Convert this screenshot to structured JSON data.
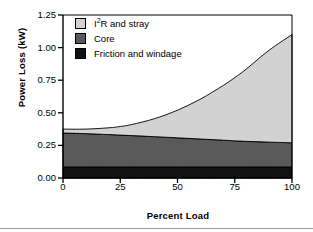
{
  "chart_data": {
    "type": "area",
    "title": "",
    "subtitle": "",
    "xlabel": "Percent Load",
    "ylabel": "Power Loss (kW)",
    "xlim": [
      0,
      100
    ],
    "ylim": [
      0.0,
      1.25
    ],
    "xticks": [
      "0",
      "25",
      "50",
      "75",
      "100"
    ],
    "xtick_values": [
      0,
      25,
      50,
      75,
      100
    ],
    "yticks": [
      "0.00",
      "0.25",
      "0.50",
      "0.75",
      "1.00",
      "1.25"
    ],
    "ytick_values": [
      0.0,
      0.25,
      0.5,
      0.75,
      1.0,
      1.25
    ],
    "grid": false,
    "stacked": true,
    "legend_position": "upper-left-inside",
    "x": [
      0,
      10,
      20,
      25,
      30,
      40,
      50,
      60,
      70,
      75,
      80,
      90,
      100
    ],
    "series": [
      {
        "name": "Friction and windage",
        "color": "#111111",
        "values": [
          0.085,
          0.085,
          0.085,
          0.085,
          0.085,
          0.085,
          0.085,
          0.085,
          0.085,
          0.085,
          0.085,
          0.085,
          0.085
        ]
      },
      {
        "name": "Core",
        "color": "#5a5a5a",
        "values": [
          0.26,
          0.255,
          0.248,
          0.244,
          0.24,
          0.232,
          0.223,
          0.214,
          0.205,
          0.2,
          0.196,
          0.19,
          0.185
        ]
      },
      {
        "name": "I2R and stray",
        "color": "#d2d2d2",
        "values": [
          0.03,
          0.035,
          0.052,
          0.066,
          0.085,
          0.138,
          0.212,
          0.306,
          0.42,
          0.485,
          0.554,
          0.705,
          0.83
        ]
      }
    ],
    "cumulative_totals": [
      0.375,
      0.375,
      0.385,
      0.395,
      0.41,
      0.455,
      0.52,
      0.605,
      0.71,
      0.77,
      0.835,
      0.98,
      1.1
    ],
    "annotations": []
  },
  "legend": {
    "items": [
      {
        "label_prefix": "I",
        "label_sup": "2",
        "label_suffix": "R and stray",
        "label_full": "I2R and stray"
      },
      {
        "label_prefix": "Core",
        "label_sup": "",
        "label_suffix": "",
        "label_full": "Core"
      },
      {
        "label_prefix": "Friction and windage",
        "label_sup": "",
        "label_suffix": "",
        "label_full": "Friction and windage"
      }
    ]
  },
  "colors": {
    "stray": "#d2d2d2",
    "core": "#5a5a5a",
    "friction": "#111111",
    "axis": "#000000",
    "background": "#ffffff",
    "rule": "#9a9a9a"
  }
}
